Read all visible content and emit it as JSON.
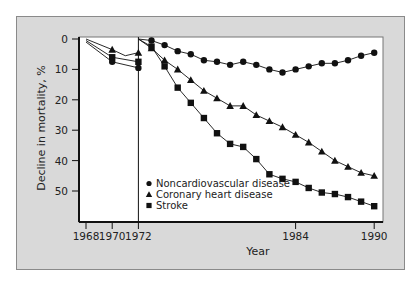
{
  "chart_data": {
    "type": "line",
    "title": "",
    "xlabel": "Year",
    "ylabel": "Decline in mortality, %",
    "y_inverted": true,
    "ylim": [
      0,
      55
    ],
    "xlim": [
      1967.5,
      1990.5
    ],
    "yticks": [
      0,
      10,
      20,
      30,
      40,
      50
    ],
    "xticks": [
      1968,
      1970,
      1972,
      1984,
      1990
    ],
    "grid": false,
    "legend_position": "lower-left inside plot",
    "annotations": [
      "Vertical divider line at 1972"
    ],
    "series": [
      {
        "name": "Noncardiovascular disease",
        "marker": "circle",
        "segment_pre1972": {
          "x": [
            1968,
            1970,
            1972
          ],
          "y": [
            1,
            7.5,
            9.5
          ]
        },
        "x": [
          1972,
          1973,
          1974,
          1975,
          1976,
          1977,
          1978,
          1979,
          1980,
          1981,
          1982,
          1983,
          1984,
          1985,
          1986,
          1987,
          1988,
          1989,
          1990
        ],
        "y": [
          0,
          0.5,
          2,
          4,
          5,
          7,
          7.5,
          8.5,
          7.5,
          8.5,
          10,
          11,
          10,
          9,
          8,
          8,
          7,
          5.5,
          4.5
        ]
      },
      {
        "name": "Coronary heart disease",
        "marker": "triangle",
        "segment_pre1972": {
          "x": [
            1968,
            1970,
            1971,
            1972
          ],
          "y": [
            0,
            3.5,
            5.5,
            4.5
          ]
        },
        "x": [
          1972,
          1973,
          1974,
          1975,
          1976,
          1977,
          1978,
          1979,
          1980,
          1981,
          1982,
          1983,
          1984,
          1985,
          1986,
          1987,
          1988,
          1989,
          1990
        ],
        "y": [
          0,
          3,
          7,
          10,
          13.5,
          17,
          19.5,
          22,
          22,
          25,
          27,
          29,
          31.5,
          34,
          37,
          40,
          42,
          44,
          45
        ]
      },
      {
        "name": "Stroke",
        "marker": "square",
        "segment_pre1972": {
          "x": [
            1968,
            1970,
            1972
          ],
          "y": [
            0.5,
            6,
            7.5
          ]
        },
        "x": [
          1972,
          1973,
          1974,
          1975,
          1976,
          1977,
          1978,
          1979,
          1980,
          1981,
          1982,
          1983,
          1984,
          1985,
          1986,
          1987,
          1988,
          1989,
          1990
        ],
        "y": [
          0,
          2.5,
          9,
          16,
          21,
          26,
          31,
          34.5,
          35.5,
          39.5,
          44.5,
          46,
          47,
          49,
          50.5,
          51,
          52,
          53.5,
          55
        ]
      }
    ]
  },
  "legend": {
    "items": [
      {
        "label": "Noncardiovascular disease",
        "marker": "circle"
      },
      {
        "label": "Coronary heart disease",
        "marker": "triangle"
      },
      {
        "label": "Stroke",
        "marker": "square"
      }
    ]
  },
  "colors": {
    "panel_bg": "#d9d9d9",
    "plot_bg": "#ffffff",
    "ink": "#111111"
  }
}
